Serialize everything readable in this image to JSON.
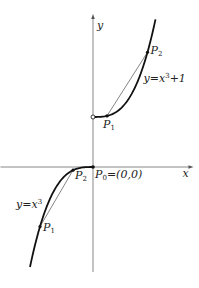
{
  "diagram": {
    "axes": {
      "x_label": "x",
      "y_label": "y",
      "x_range": [
        -1.85,
        1.95
      ],
      "y_range": [
        -2.1,
        3.0
      ]
    },
    "curves": [
      {
        "name": "upper",
        "equation_label": "y = x³+1",
        "eq_prefix": "y",
        "eq_eq": "=",
        "eq_var": "x",
        "eq_exp": "3",
        "eq_suffix": "+1",
        "offset": 1,
        "domain": [
          0,
          1.25
        ],
        "open_endpoint": [
          0,
          1
        ],
        "points": [
          {
            "label": "P",
            "sub": "1",
            "x": 0.28
          },
          {
            "label": "P",
            "sub": "2",
            "x": 1.09
          }
        ]
      },
      {
        "name": "lower",
        "equation_label": "y = x³",
        "eq_prefix": "y",
        "eq_eq": "=",
        "eq_var": "x",
        "eq_exp": "3",
        "offset": 0,
        "domain": [
          -1.26,
          0
        ],
        "closed_endpoint": [
          0,
          0
        ],
        "points": [
          {
            "label": "P",
            "sub": "1",
            "x": -1.06
          },
          {
            "label": "P",
            "sub": "2",
            "x": -0.4
          }
        ]
      }
    ],
    "origin_label": {
      "label": "P",
      "sub": "0",
      "text": "=(0,0)"
    }
  }
}
